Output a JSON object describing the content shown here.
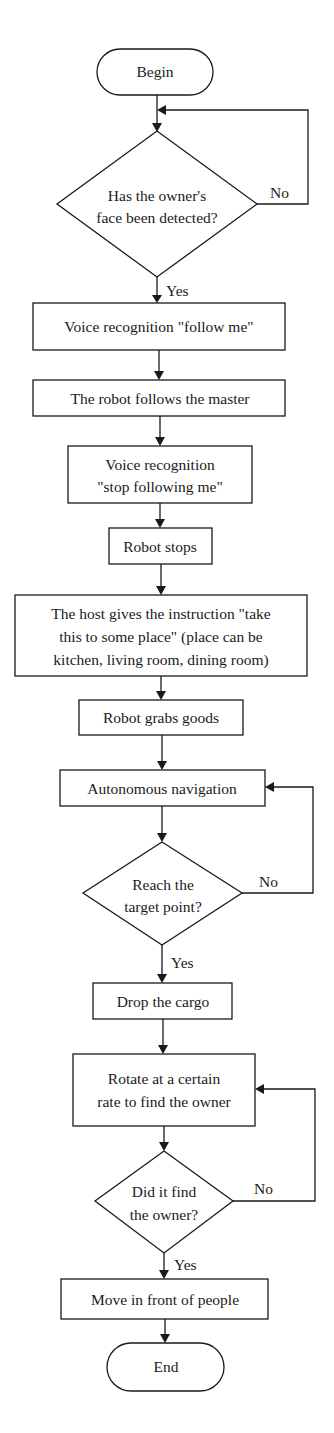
{
  "diagram": {
    "type": "flowchart",
    "nodes": {
      "begin": {
        "kind": "terminal",
        "label": "Begin"
      },
      "face_check": {
        "kind": "decision",
        "lines": [
          "Has the owner's",
          "face been detected?"
        ]
      },
      "voice_follow": {
        "kind": "process",
        "label": "Voice recognition \"follow me\""
      },
      "follows": {
        "kind": "process",
        "label": "The robot follows the master"
      },
      "voice_stop": {
        "kind": "process",
        "lines": [
          "Voice recognition",
          "\"stop following me\""
        ]
      },
      "stops": {
        "kind": "process",
        "label": "Robot stops"
      },
      "instruction": {
        "kind": "process",
        "lines": [
          "The host gives the instruction \"take",
          "this to some place\" (place can be",
          "kitchen, living room, dining room)"
        ]
      },
      "grabs": {
        "kind": "process",
        "label": "Robot grabs goods"
      },
      "navigation": {
        "kind": "process",
        "label": "Autonomous navigation"
      },
      "reach_check": {
        "kind": "decision",
        "lines": [
          "Reach the",
          "target point?"
        ]
      },
      "drop": {
        "kind": "process",
        "label": "Drop the cargo"
      },
      "rotate": {
        "kind": "process",
        "lines": [
          "Rotate at a certain",
          "rate to find the owner"
        ]
      },
      "owner_check": {
        "kind": "decision",
        "lines": [
          "Did it find",
          "the owner?"
        ]
      },
      "move": {
        "kind": "process",
        "label": "Move in front of people"
      },
      "end": {
        "kind": "terminal",
        "label": "End"
      }
    },
    "edge_labels": {
      "face_yes": "Yes",
      "face_no": "No",
      "reach_yes": "Yes",
      "reach_no": "No",
      "owner_yes": "Yes",
      "owner_no": "No"
    },
    "edges": [
      [
        "begin",
        "face_check"
      ],
      [
        "face_check",
        "face_check",
        "No"
      ],
      [
        "face_check",
        "voice_follow",
        "Yes"
      ],
      [
        "voice_follow",
        "follows"
      ],
      [
        "follows",
        "voice_stop"
      ],
      [
        "voice_stop",
        "stops"
      ],
      [
        "stops",
        "instruction"
      ],
      [
        "instruction",
        "grabs"
      ],
      [
        "grabs",
        "navigation"
      ],
      [
        "navigation",
        "reach_check"
      ],
      [
        "reach_check",
        "navigation",
        "No"
      ],
      [
        "reach_check",
        "drop",
        "Yes"
      ],
      [
        "drop",
        "rotate"
      ],
      [
        "rotate",
        "owner_check"
      ],
      [
        "owner_check",
        "rotate",
        "No"
      ],
      [
        "owner_check",
        "move",
        "Yes"
      ],
      [
        "move",
        "end"
      ]
    ]
  }
}
